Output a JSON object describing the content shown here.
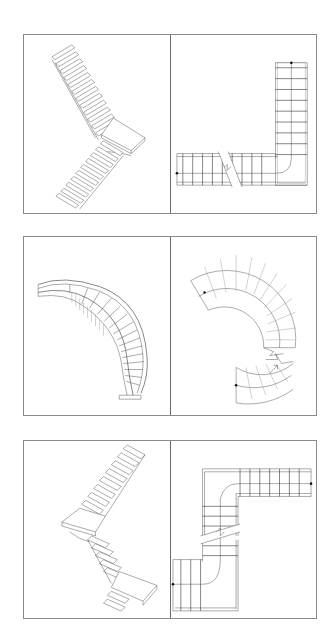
{
  "page": {
    "background": "#ffffff",
    "line_color": "#555555",
    "frame_color": "#8a8a8a"
  },
  "figures": [
    {
      "id": "row-1",
      "left": {
        "view": "isometric",
        "subject": "l-shaped-stair-with-landing"
      },
      "right": {
        "view": "plan",
        "subject": "l-shaped-stair-plan",
        "break_symbol": "zigzag",
        "endpoints": 2
      }
    },
    {
      "id": "row-2",
      "left": {
        "view": "isometric",
        "subject": "curved-helical-stair"
      },
      "right": {
        "view": "plan",
        "subject": "curved-stair-plan",
        "break_symbol": "zigzag",
        "endpoints": 2
      }
    },
    {
      "id": "row-3",
      "left": {
        "view": "isometric",
        "subject": "u-shaped-stair-with-two-landings"
      },
      "right": {
        "view": "plan",
        "subject": "u-shaped-stair-plan",
        "break_symbol": "zigzag",
        "endpoints": 2
      }
    }
  ]
}
